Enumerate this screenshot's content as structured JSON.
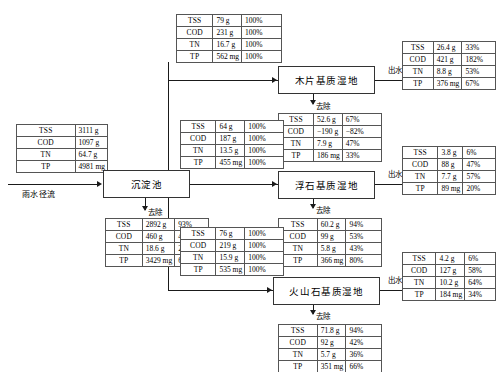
{
  "labels": {
    "inflow": "雨水径流",
    "removal": "去除",
    "effluent": "出水"
  },
  "settling_tank": {
    "name": "沉淀池"
  },
  "wetlands": [
    {
      "name": "木片基质湿地"
    },
    {
      "name": "浮石基质湿地"
    },
    {
      "name": "火山石基质湿地"
    }
  ],
  "tables": {
    "influent": {
      "rows": [
        {
          "key": "TSS",
          "value": "3111 g"
        },
        {
          "key": "COD",
          "value": "1097 g"
        },
        {
          "key": "TN",
          "value": "64.7 g"
        },
        {
          "key": "TP",
          "value": "4981 mg"
        }
      ]
    },
    "settling_removal": {
      "rows": [
        {
          "key": "TSS",
          "value": "2892 g",
          "pct": "93%"
        },
        {
          "key": "COD",
          "value": "460 g",
          "pct": "42%"
        },
        {
          "key": "TN",
          "value": "18.6 g",
          "pct": "29%"
        },
        {
          "key": "TP",
          "value": "3429 mg",
          "pct": "69%"
        }
      ]
    },
    "branch_top_in": {
      "rows": [
        {
          "key": "TSS",
          "value": "79 g",
          "pct": "100%"
        },
        {
          "key": "COD",
          "value": "231 g",
          "pct": "100%"
        },
        {
          "key": "TN",
          "value": "16.7 g",
          "pct": "100%"
        },
        {
          "key": "TP",
          "value": "562 mg",
          "pct": "100%"
        }
      ]
    },
    "branch_top_removal": {
      "rows": [
        {
          "key": "TSS",
          "value": "52.6 g",
          "pct": "67%"
        },
        {
          "key": "COD",
          "value": "−190 g",
          "pct": "−82%"
        },
        {
          "key": "TN",
          "value": "7.9 g",
          "pct": "47%"
        },
        {
          "key": "TP",
          "value": "186 mg",
          "pct": "33%"
        }
      ]
    },
    "branch_top_out": {
      "rows": [
        {
          "key": "TSS",
          "value": "26.4 g",
          "pct": "33%"
        },
        {
          "key": "COD",
          "value": "421 g",
          "pct": "182%"
        },
        {
          "key": "TN",
          "value": "8.8 g",
          "pct": "53%"
        },
        {
          "key": "TP",
          "value": "376 mg",
          "pct": "67%"
        }
      ]
    },
    "branch_mid_in": {
      "rows": [
        {
          "key": "TSS",
          "value": "64 g",
          "pct": "100%"
        },
        {
          "key": "COD",
          "value": "187 g",
          "pct": "100%"
        },
        {
          "key": "TN",
          "value": "13.5 g",
          "pct": "100%"
        },
        {
          "key": "TP",
          "value": "455 mg",
          "pct": "100%"
        }
      ]
    },
    "branch_mid_removal": {
      "rows": [
        {
          "key": "TSS",
          "value": "60.2 g",
          "pct": "94%"
        },
        {
          "key": "COD",
          "value": "99 g",
          "pct": "53%"
        },
        {
          "key": "TN",
          "value": "5.8 g",
          "pct": "43%"
        },
        {
          "key": "TP",
          "value": "366 mg",
          "pct": "80%"
        }
      ]
    },
    "branch_mid_out": {
      "rows": [
        {
          "key": "TSS",
          "value": "3.8 g",
          "pct": "6%"
        },
        {
          "key": "COD",
          "value": "88 g",
          "pct": "47%"
        },
        {
          "key": "TN",
          "value": "7.7 g",
          "pct": "57%"
        },
        {
          "key": "TP",
          "value": "89 mg",
          "pct": "20%"
        }
      ]
    },
    "branch_bot_in": {
      "rows": [
        {
          "key": "TSS",
          "value": "76 g",
          "pct": "100%"
        },
        {
          "key": "COD",
          "value": "219 g",
          "pct": "100%"
        },
        {
          "key": "TN",
          "value": "15.9 g",
          "pct": "100%"
        },
        {
          "key": "TP",
          "value": "535 mg",
          "pct": "100%"
        }
      ]
    },
    "branch_bot_removal": {
      "rows": [
        {
          "key": "TSS",
          "value": "71.8 g",
          "pct": "94%"
        },
        {
          "key": "COD",
          "value": "92 g",
          "pct": "42%"
        },
        {
          "key": "TN",
          "value": "5.7 g",
          "pct": "36%"
        },
        {
          "key": "TP",
          "value": "351 mg",
          "pct": "66%"
        }
      ]
    },
    "branch_bot_out": {
      "rows": [
        {
          "key": "TSS",
          "value": "4.2 g",
          "pct": "6%"
        },
        {
          "key": "COD",
          "value": "127 g",
          "pct": "58%"
        },
        {
          "key": "TN",
          "value": "10.2 g",
          "pct": "64%"
        },
        {
          "key": "TP",
          "value": "184 mg",
          "pct": "34%"
        }
      ]
    }
  }
}
